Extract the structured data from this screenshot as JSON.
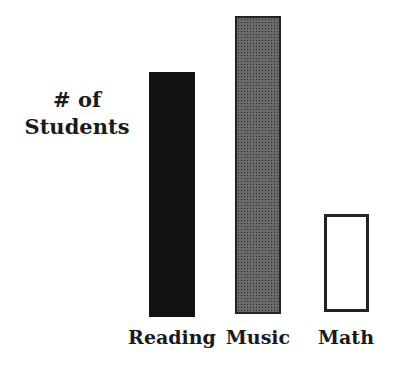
{
  "chart_data": {
    "type": "bar",
    "title": "",
    "xlabel": "",
    "ylabel": "# of Students",
    "ylabel_lines": [
      "# of",
      "Students"
    ],
    "categories": [
      "Reading",
      "Music",
      "Math"
    ],
    "values": [
      245,
      298,
      98
    ],
    "value_note": "relative bar heights (no y-axis scale shown)",
    "bar_styles": [
      "solid black",
      "dotted gray",
      "hollow outline"
    ],
    "ylim": [
      0,
      300
    ],
    "grid": false,
    "legend": null
  }
}
